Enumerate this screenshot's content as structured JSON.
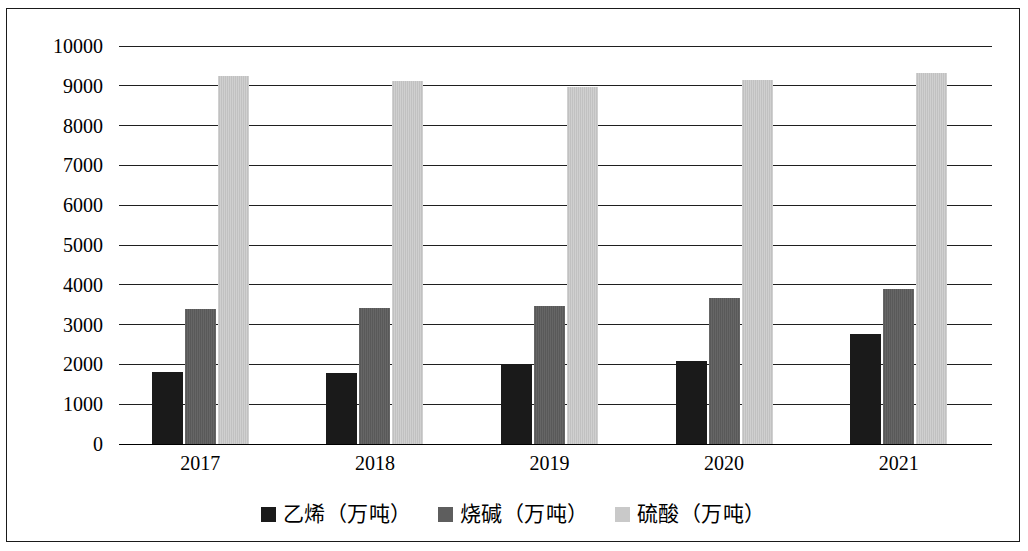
{
  "chart_data": {
    "type": "bar",
    "title": "",
    "subtitle": "",
    "xlabel": "",
    "ylabel": "",
    "categories": [
      "2017",
      "2018",
      "2019",
      "2020",
      "2021"
    ],
    "series": [
      {
        "name": "乙烯（万吨）",
        "color": "#1a1a1a",
        "values": [
          1800,
          1780,
          2000,
          2080,
          2760
        ]
      },
      {
        "name": "烧碱（万吨）",
        "color": "#5e5e5e",
        "values": [
          3400,
          3430,
          3460,
          3680,
          3890
        ]
      },
      {
        "name": "硫酸（万吨）",
        "color": "#c9c9c9",
        "values": [
          9250,
          9120,
          8980,
          9150,
          9330
        ]
      }
    ],
    "ylim": [
      0,
      10000
    ],
    "ytick_values": [
      0,
      1000,
      2000,
      3000,
      4000,
      5000,
      6000,
      7000,
      8000,
      9000,
      10000
    ],
    "ytick_labels": [
      "0",
      "1000",
      "2000",
      "3000",
      "4000",
      "5000",
      "6000",
      "7000",
      "8000",
      "9000",
      "10000"
    ],
    "grid": true,
    "legend_position": "bottom",
    "border": true
  },
  "legend": {
    "items": [
      {
        "label": "乙烯（万吨）",
        "swatch": "legend-swatch-ethylene"
      },
      {
        "label": "烧碱（万吨）",
        "swatch": "legend-swatch-caustic-soda"
      },
      {
        "label": "硫酸（万吨）",
        "swatch": "legend-swatch-sulfuric-acid"
      }
    ]
  }
}
